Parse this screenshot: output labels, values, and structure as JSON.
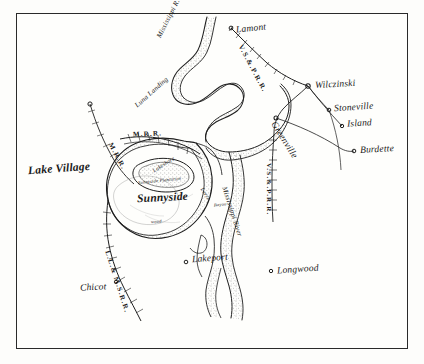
{
  "map": {
    "title": "Sunnyside Plantation Sketch Map",
    "frame": {
      "border_color": "#2a2a2a",
      "background": "#fefefc"
    },
    "ink_color": "#1a1a1a",
    "paper_color": "#fdfdfb"
  },
  "places": [
    {
      "id": "lake-village",
      "label": "Lake Village",
      "x": 28,
      "y": 168,
      "cls": "place-big",
      "rotate": -4
    },
    {
      "id": "sunnyside",
      "label": "Sunnyside",
      "x": 137,
      "y": 197,
      "cls": "place-big",
      "rotate": -3
    },
    {
      "id": "lamont",
      "label": "Lamont",
      "x": 236,
      "y": 29,
      "cls": "place",
      "rotate": -6
    },
    {
      "id": "wilczinski",
      "label": "Wilczinski",
      "x": 315,
      "y": 85,
      "cls": "place",
      "rotate": -3
    },
    {
      "id": "stoneville",
      "label": "Stoneville",
      "x": 334,
      "y": 108,
      "cls": "place",
      "rotate": -4
    },
    {
      "id": "island",
      "label": "Island",
      "x": 347,
      "y": 124,
      "cls": "place",
      "rotate": -3
    },
    {
      "id": "greenville",
      "label": "Greenville",
      "x": 279,
      "y": 122,
      "cls": "place",
      "rotate": 58
    },
    {
      "id": "burdette",
      "label": "Burdette",
      "x": 360,
      "y": 150,
      "cls": "place",
      "rotate": -3
    },
    {
      "id": "lakeport",
      "label": "Lakeport",
      "x": 192,
      "y": 259,
      "cls": "place",
      "rotate": -4
    },
    {
      "id": "longwood",
      "label": "Longwood",
      "x": 277,
      "y": 270,
      "cls": "place",
      "rotate": -4
    },
    {
      "id": "chicot",
      "label": "Chicot",
      "x": 80,
      "y": 288,
      "cls": "place",
      "rotate": -3
    },
    {
      "id": "luna-landing",
      "label": "Luna Landing",
      "x": 134,
      "y": 104,
      "cls": "hydro",
      "rotate": -42
    }
  ],
  "hydrography": [
    {
      "id": "mississippi-r-north",
      "label": "Mississippi R.",
      "x": 156,
      "y": 36,
      "rotate": -63
    },
    {
      "id": "mississippi-river-east",
      "label": "Mississippi River",
      "x": 227,
      "y": 186,
      "rotate": 72
    },
    {
      "id": "lake-chicot-interior",
      "label": "Lake Chicot",
      "x": 150,
      "y": 166,
      "rotate": -10
    }
  ],
  "railroads": [
    {
      "id": "vsp-rr-north",
      "label": "V.S.&.P.R.R.",
      "x": 243,
      "y": 44,
      "rotate": 62
    },
    {
      "id": "vsp-rr-east",
      "label": "V.S.&.P.R.R.",
      "x": 272,
      "y": 166,
      "rotate": 90
    },
    {
      "id": "m-rr-west",
      "label": "M.R.R.",
      "x": 133,
      "y": 134,
      "rotate": -2
    },
    {
      "id": "m-rr-spur",
      "label": "M.R.R.",
      "x": 114,
      "y": 142,
      "rotate": 62
    },
    {
      "id": "llm-s-rr",
      "label": "L.L.& M.S.R.R.",
      "x": 110,
      "y": 252,
      "rotate": 72
    }
  ],
  "annotations": [
    {
      "id": "lakeshore-note",
      "label": "Lakeshore",
      "x": 152,
      "y": 171,
      "rotate": -32
    },
    {
      "id": "levee-note",
      "label": "Levee",
      "x": 204,
      "y": 189,
      "rotate": 58
    },
    {
      "id": "bayou-note",
      "label": "Bayou",
      "x": 215,
      "y": 204,
      "rotate": -6
    },
    {
      "id": "wood-note",
      "label": "wood",
      "x": 151,
      "y": 222,
      "rotate": -4
    },
    {
      "id": "plantation-note",
      "label": "Sunnyside Plantation",
      "x": 140,
      "y": 180,
      "rotate": -6
    }
  ],
  "station_dots": [
    {
      "id": "dot-lake-village-terminus",
      "x": 90,
      "y": 104
    },
    {
      "id": "dot-lamont",
      "x": 231,
      "y": 28
    },
    {
      "id": "dot-wilczinski",
      "x": 308,
      "y": 86
    },
    {
      "id": "dot-stoneville",
      "x": 329,
      "y": 110
    },
    {
      "id": "dot-island",
      "x": 342,
      "y": 126
    },
    {
      "id": "dot-burdette",
      "x": 354,
      "y": 151
    },
    {
      "id": "dot-greenville",
      "x": 276,
      "y": 118
    },
    {
      "id": "dot-lakeport",
      "x": 186,
      "y": 262
    },
    {
      "id": "dot-chicot-rail",
      "x": 116,
      "y": 282
    },
    {
      "id": "dot-longwood",
      "x": 271,
      "y": 271
    }
  ]
}
